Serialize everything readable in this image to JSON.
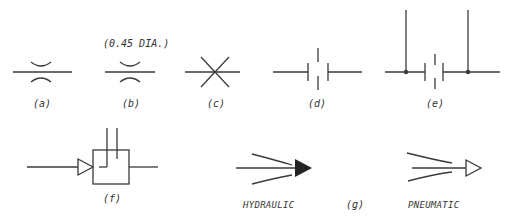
{
  "figure": {
    "symbols": [
      {
        "id": "a",
        "label": "(a)",
        "description": "flow restrictor / orifice (curved walls)"
      },
      {
        "id": "b",
        "label": "(b)",
        "annotation": "(0.45 DIA.)",
        "description": "orifice with diameter annotation"
      },
      {
        "id": "c",
        "label": "(c)",
        "description": "crossed lines"
      },
      {
        "id": "d",
        "label": "(d)",
        "description": "capacitor-like double plate symbol"
      },
      {
        "id": "e",
        "label": "(e)",
        "description": "double plate symbol with tapped vertical leads"
      },
      {
        "id": "f",
        "label": "(f)",
        "description": "amplifier triangle into box with two inlet lines"
      },
      {
        "id": "g",
        "label": "(g)",
        "description": "flow arrows",
        "variants": [
          {
            "name": "HYDRAULIC",
            "arrowhead": "filled"
          },
          {
            "name": "PNEUMATIC",
            "arrowhead": "open"
          }
        ]
      }
    ],
    "colors": {
      "stroke": "#3a3a3a",
      "background": "#ffffff"
    }
  }
}
